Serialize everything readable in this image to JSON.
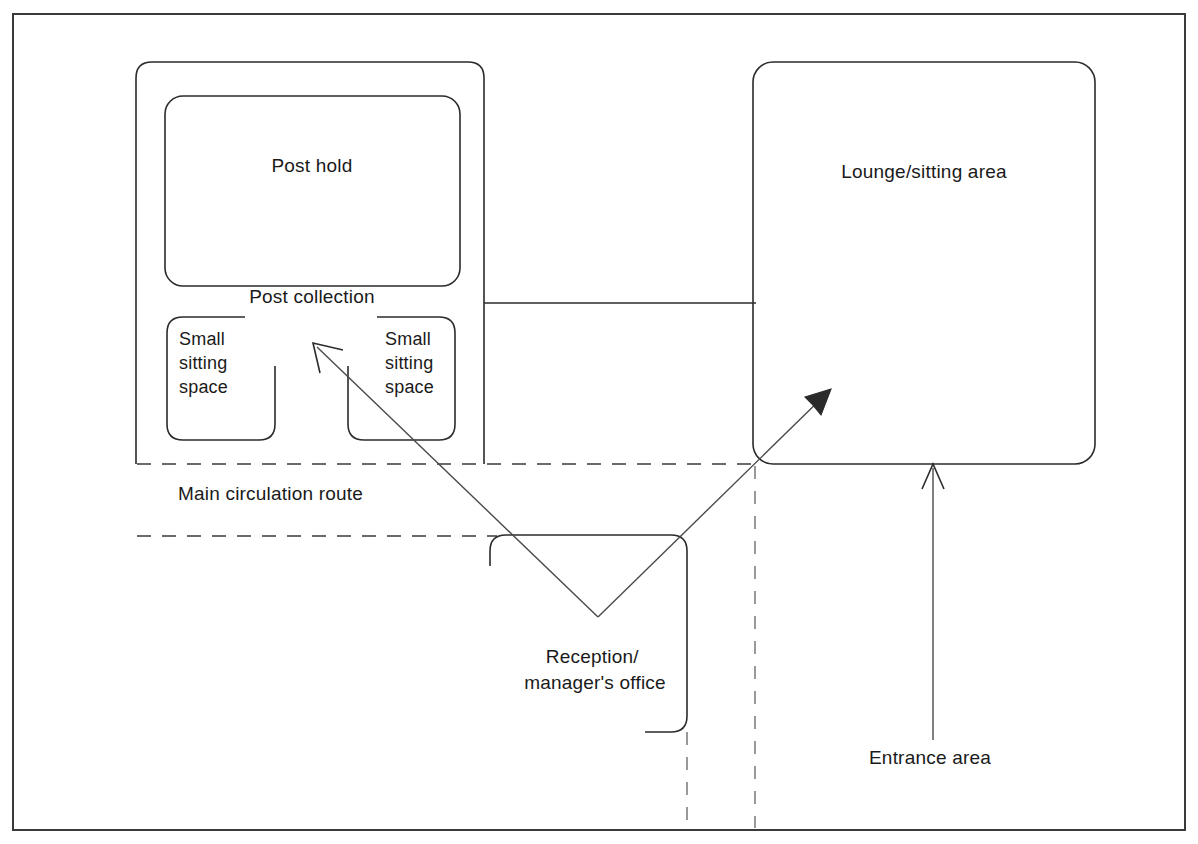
{
  "diagram": {
    "type": "architectural-bubble-plan",
    "background_color": "#ffffff",
    "line_color": "#2b2b2b",
    "text_color": "#1a1a1a",
    "frame": {
      "x": 13,
      "y": 14,
      "width": 1172,
      "height": 816
    },
    "rooms": [
      {
        "id": "post-area",
        "label": "",
        "shape": "rounded-rect",
        "x": 136,
        "y": 62,
        "width": 348,
        "height": 402,
        "note": "outer enclosure containing post hold and small sitting spaces"
      },
      {
        "id": "post-hold",
        "label": "Post hold",
        "shape": "rounded-rect",
        "x": 165,
        "y": 96,
        "width": 295,
        "height": 190,
        "label_x": 312,
        "label_y": 172
      },
      {
        "id": "post-collection",
        "label": "Post collection",
        "shape": "text-only",
        "label_x": 312,
        "label_y": 303
      },
      {
        "id": "small-sitting-space-left",
        "label": "Small\nsitting\nspace",
        "label_lines": [
          "Small",
          "sitting",
          "space"
        ],
        "shape": "rounded-rect-open-right",
        "x": 167,
        "y": 317,
        "width": 108,
        "height": 123,
        "label_x": 179,
        "label_y": 345
      },
      {
        "id": "small-sitting-space-right",
        "label": "Small\nsitting\nspace",
        "label_lines": [
          "Small",
          "sitting",
          "space"
        ],
        "shape": "rounded-rect-open-left",
        "x": 348,
        "y": 317,
        "width": 107,
        "height": 123,
        "label_x": 385,
        "label_y": 345
      },
      {
        "id": "lounge-sitting-area",
        "label": "Lounge/sitting area",
        "shape": "rounded-rect",
        "x": 753,
        "y": 62,
        "width": 342,
        "height": 402,
        "label_x": 924,
        "label_y": 178
      },
      {
        "id": "reception-managers-office",
        "label": "Reception/\nmanager's office",
        "label_lines": [
          "Reception/",
          "manager's office"
        ],
        "shape": "open-rect",
        "x": 490,
        "y": 535,
        "width": 197,
        "height": 197,
        "label_x": 595,
        "label_y": 663
      }
    ],
    "annotations": [
      {
        "id": "main-circulation-route",
        "label": "Main circulation route",
        "label_x": 178,
        "label_y": 500,
        "style": "dashed-corridor",
        "corridor_top_y": 464,
        "corridor_bottom_y": 536,
        "corridor_x_start": 137,
        "corridor_x_end": 760
      },
      {
        "id": "entrance-area",
        "label": "Entrance area",
        "label_x": 869,
        "label_y": 764,
        "arrow": {
          "from_x": 933,
          "from_y": 740,
          "to_x": 933,
          "to_y": 466
        }
      }
    ],
    "leader_arrows": [
      {
        "id": "reception-to-small-sitting-space",
        "from_x": 598,
        "from_y": 617,
        "to_x": 313,
        "to_y": 343
      },
      {
        "id": "reception-to-lounge",
        "from_x": 598,
        "from_y": 617,
        "to_x": 831,
        "to_y": 389
      }
    ],
    "connectors": [
      {
        "id": "post-to-lounge-link",
        "points": "484,286 484,464",
        "kind": "vertical"
      },
      {
        "id": "post-lounge-horizontal-link",
        "points": "484,303 755,303",
        "kind": "horizontal"
      }
    ],
    "dashed_verticals": [
      {
        "id": "reception-right-extension",
        "x": 687,
        "y1": 732,
        "y2": 830
      },
      {
        "id": "lounge-left-extension",
        "x": 755,
        "y1": 466,
        "y2": 830
      }
    ]
  }
}
